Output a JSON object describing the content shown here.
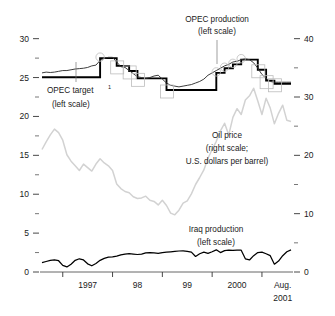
{
  "chart_data": {
    "type": "line",
    "title": "",
    "xlabel": "",
    "ylabel": "",
    "grid": false,
    "legend_position": "inline-annotations",
    "x_axis": {
      "tick_labels": [
        "1997",
        "98",
        "99",
        "2000",
        "Aug.",
        "2001"
      ],
      "tick_label_main": [
        "1997",
        "98",
        "99",
        "2000"
      ],
      "end_label_line1": "Aug.",
      "end_label_line2": "2001",
      "range_start": "1996-08",
      "range_end": "2001-08"
    },
    "left_axis": {
      "label": "(left scale)",
      "ticks": [
        0,
        5,
        10,
        15,
        20,
        25,
        30
      ],
      "tick_labels": [
        "0",
        "5",
        "10",
        "15",
        "20",
        "25",
        "30"
      ],
      "minor_ticks": [
        2.5,
        7.5,
        12.5,
        17.5,
        22.5,
        27.5
      ],
      "ylim": [
        0,
        31.5
      ]
    },
    "right_axis": {
      "label": "(right scale)",
      "ticks": [
        0,
        10,
        20,
        30,
        40
      ],
      "tick_labels": [
        "0",
        "10",
        "20",
        "30",
        "40"
      ],
      "minor_ticks": [
        5,
        15,
        25,
        35
      ],
      "ylim": [
        0,
        42
      ]
    },
    "annotations": [
      {
        "name": "opec-production",
        "line1": "OPEC production",
        "line2": "(left scale)"
      },
      {
        "name": "opec-target",
        "line1": "OPEC target",
        "superscript": "1",
        "line2": "(left scale)"
      },
      {
        "name": "oil-price",
        "line1": "Oil price",
        "line2": "(right scale;",
        "line3": "U.S. dollars per barrel)"
      },
      {
        "name": "iraq-production",
        "line1": "Iraq production",
        "line2": "(left scale)"
      }
    ],
    "colors": {
      "opec_target": "#000000",
      "opec_production": "#333333",
      "oil_price": "#d2d2d2",
      "iraq_production": "#000000",
      "axis": "#555555",
      "marker_outline": "#bcbcbc"
    },
    "series": [
      {
        "name": "OPEC target",
        "axis": "left",
        "units": "millions of barrels per day",
        "style": "step",
        "values": [
          25.03,
          25.03,
          25.03,
          25.03,
          25.03,
          25.03,
          25.03,
          25.03,
          25.03,
          25.03,
          25.03,
          25.03,
          25.03,
          25.03,
          27.5,
          27.5,
          27.5,
          27.5,
          26.5,
          26.5,
          26.5,
          25.85,
          25.85,
          24.9,
          24.9,
          24.9,
          24.9,
          24.9,
          24.9,
          24.9,
          23.4,
          23.4,
          23.4,
          23.4,
          23.4,
          23.4,
          23.4,
          23.4,
          23.4,
          23.4,
          23.4,
          23.4,
          25.6,
          25.6,
          26.2,
          26.2,
          26.7,
          26.7,
          27.3,
          27.3,
          27.3,
          27.3,
          26.0,
          26.0,
          24.6,
          24.6,
          24.2,
          24.2,
          24.2,
          24.2,
          24.2
        ]
      },
      {
        "name": "OPEC production",
        "axis": "left",
        "units": "millions of barrels per day",
        "style": "line",
        "values": [
          25.6,
          25.7,
          25.65,
          25.7,
          25.8,
          25.9,
          25.9,
          26.0,
          26.1,
          26.15,
          26.2,
          26.3,
          26.5,
          26.6,
          27.2,
          27.5,
          27.6,
          27.6,
          27.0,
          26.4,
          26.3,
          25.9,
          25.5,
          25.1,
          25.0,
          24.9,
          25.0,
          25.2,
          25.3,
          24.8,
          24.3,
          24.0,
          23.9,
          23.8,
          23.9,
          24.0,
          24.1,
          24.3,
          24.5,
          24.8,
          25.3,
          25.6,
          25.9,
          26.2,
          26.5,
          26.7,
          27.0,
          27.1,
          27.3,
          27.4,
          27.3,
          26.9,
          26.2,
          25.4,
          24.9,
          24.5,
          24.4,
          24.4,
          24.4,
          24.4,
          24.4
        ]
      },
      {
        "name": "Oil price",
        "axis": "right",
        "units": "U.S. dollars per barrel",
        "style": "line",
        "values": [
          21.0,
          22.3,
          23.5,
          24.5,
          23.9,
          22.6,
          20.1,
          19.0,
          18.2,
          17.4,
          18.5,
          17.9,
          17.3,
          18.5,
          19.4,
          18.7,
          18.2,
          17.4,
          15.1,
          14.3,
          13.8,
          13.6,
          12.9,
          12.6,
          12.7,
          13.0,
          12.3,
          12.1,
          11.5,
          12.3,
          11.4,
          10.1,
          9.8,
          10.6,
          11.8,
          12.2,
          13.4,
          15.0,
          16.2,
          17.5,
          19.5,
          21.0,
          22.4,
          24.2,
          25.5,
          23.5,
          26.5,
          28.0,
          27.0,
          29.5,
          30.2,
          31.5,
          29.3,
          27.0,
          29.8,
          28.1,
          25.4,
          27.2,
          28.6,
          26.0,
          25.8
        ]
      },
      {
        "name": "Iraq production",
        "axis": "left",
        "units": "millions of barrels per day",
        "style": "line",
        "values": [
          1.2,
          1.35,
          1.5,
          1.55,
          1.45,
          0.85,
          0.65,
          1.0,
          1.5,
          1.7,
          1.55,
          1.05,
          0.8,
          1.1,
          1.5,
          1.75,
          1.9,
          1.95,
          2.05,
          2.2,
          2.3,
          2.35,
          2.3,
          2.25,
          2.3,
          2.45,
          2.5,
          2.45,
          2.4,
          2.5,
          2.55,
          2.6,
          2.65,
          2.7,
          2.72,
          2.65,
          2.55,
          2.0,
          2.35,
          2.55,
          2.4,
          2.6,
          2.85,
          2.5,
          2.75,
          2.8,
          2.78,
          2.82,
          2.8,
          1.7,
          1.55,
          2.1,
          2.5,
          2.55,
          2.35,
          2.1,
          1.0,
          1.4,
          2.1,
          2.6,
          2.85
        ]
      }
    ],
    "markers": [
      {
        "shape": "circle",
        "x_index": 14,
        "series": "OPEC target"
      },
      {
        "shape": "square",
        "x_index": 18,
        "series": "OPEC target"
      },
      {
        "shape": "square",
        "x_index": 21,
        "series": "OPEC target"
      },
      {
        "shape": "square",
        "x_index": 23,
        "series": "OPEC target"
      },
      {
        "shape": "square",
        "x_index": 30,
        "series": "OPEC target"
      },
      {
        "shape": "circle",
        "x_index": 42,
        "series": "OPEC target"
      },
      {
        "shape": "circle",
        "x_index": 44,
        "series": "OPEC target"
      },
      {
        "shape": "circle",
        "x_index": 46,
        "series": "OPEC target"
      },
      {
        "shape": "circle",
        "x_index": 48,
        "series": "OPEC target"
      },
      {
        "shape": "square",
        "x_index": 52,
        "series": "OPEC target"
      },
      {
        "shape": "square",
        "x_index": 54,
        "series": "OPEC target"
      },
      {
        "shape": "square",
        "x_index": 56,
        "series": "OPEC target"
      }
    ]
  }
}
